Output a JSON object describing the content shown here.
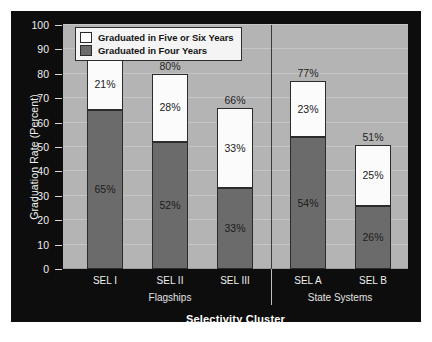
{
  "chart_data": {
    "type": "bar",
    "subtype": "stacked-bar",
    "title": "",
    "xlabel": "Selectivity Cluster",
    "ylabel": "Graduation Rate (Percent)",
    "ylim": [
      0,
      100
    ],
    "ytick_step": 10,
    "yticks": [
      "100",
      "90",
      "80",
      "70",
      "60",
      "50",
      "40",
      "30",
      "20",
      "10",
      "0"
    ],
    "grid": true,
    "legend_position": "top-left-inside",
    "categories": [
      "SEL I",
      "SEL II",
      "SEL III",
      "SEL A",
      "SEL B"
    ],
    "groups": [
      {
        "label": "Flagships",
        "categories": [
          "SEL I",
          "SEL II",
          "SEL III"
        ]
      },
      {
        "label": "State Systems",
        "categories": [
          "SEL A",
          "SEL B"
        ]
      }
    ],
    "series": [
      {
        "name": "Graduated in Four Years",
        "color": "#6b6b6b",
        "values": [
          65,
          52,
          33,
          54,
          26
        ],
        "labels": [
          "65%",
          "52%",
          "33%",
          "54%",
          "26%"
        ]
      },
      {
        "name": "Graduated in Five or Six Years",
        "color": "#ffffff",
        "values": [
          21,
          28,
          33,
          23,
          25
        ],
        "labels": [
          "21%",
          "28%",
          "33%",
          "23%",
          "25%"
        ]
      }
    ],
    "totals": [
      86,
      80,
      66,
      77,
      51
    ],
    "total_labels": [
      "86%",
      "80%",
      "66%",
      "77%",
      "51%"
    ]
  },
  "legend": {
    "items": [
      {
        "label": "Graduated in Five or Six Years",
        "swatch": "five"
      },
      {
        "label": "Graduated in Four Years",
        "swatch": "four"
      }
    ]
  },
  "axis": {
    "y_title": "Graduation Rate (Percent)",
    "x_title": "Selectivity Cluster",
    "y_ticks": [
      "100",
      "90",
      "80",
      "70",
      "60",
      "50",
      "40",
      "30",
      "20",
      "10",
      "0"
    ],
    "x_ticks": [
      "SEL I",
      "SEL II",
      "SEL III",
      "SEL A",
      "SEL B"
    ],
    "group_labels": [
      "Flagships",
      "State Systems"
    ]
  },
  "colors": {
    "panel_background": "#0d0d0d",
    "plot_background": "#b4b4b4",
    "gridline": "#c6c6c6",
    "four_year_bar": "#6b6b6b",
    "five_six_year_bar": "#ffffff",
    "bar_outline": "#2b2b2b",
    "axis_text": "#efefef"
  }
}
